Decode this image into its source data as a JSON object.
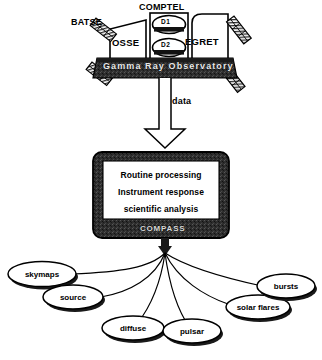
{
  "diagram": {
    "colors": {
      "background": "#ffffff",
      "stroke": "#000000",
      "dark_fill": "#2b2b2b",
      "light_text": "#e8e8e8",
      "panel_fill": "#ffffff"
    },
    "spacecraft": {
      "bus_label": "Gamma Ray Observatory",
      "instruments": [
        {
          "id": "batse",
          "label": "BATSE"
        },
        {
          "id": "osse",
          "label": "OSSE"
        },
        {
          "id": "comptel",
          "label": "COMPTEL"
        },
        {
          "id": "egret",
          "label": "EGRET"
        }
      ],
      "comptel_detectors": [
        {
          "id": "d1",
          "label": "D1"
        },
        {
          "id": "d2",
          "label": "D2"
        }
      ],
      "solar_panels": 4
    },
    "flow": {
      "data_arrow_label": "data"
    },
    "processing": {
      "system_label": "COMPASS",
      "tasks": [
        "Routine processing",
        "Instrument response",
        "scientific analysis"
      ]
    },
    "outputs": [
      {
        "id": "skymaps",
        "label": "skymaps"
      },
      {
        "id": "source",
        "label": "source"
      },
      {
        "id": "diffuse",
        "label": "diffuse"
      },
      {
        "id": "pulsar",
        "label": "pulsar"
      },
      {
        "id": "solar-flares",
        "label": "solar  flares"
      },
      {
        "id": "bursts",
        "label": "bursts"
      }
    ]
  }
}
